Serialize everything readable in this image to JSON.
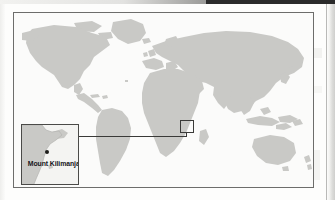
{
  "figure": {
    "kind": "locator-map"
  },
  "map": {
    "projection_note": "world",
    "ocean_color": "#fbfbfa",
    "land_color": "#c9c9c6",
    "frame_color": "#6d6d6b"
  },
  "locator": {
    "name": "locator-rectangle",
    "stroke_color": "#3a3a38",
    "region": "East Africa"
  },
  "connector": {
    "name": "leader-line",
    "stroke_color": "#3a3a38"
  },
  "inset": {
    "name": "detail-inset",
    "border_color": "#4a4a48",
    "background_color": "#f4f4f2",
    "land_color": "#c9c9c6",
    "marker": {
      "name": "summit-marker",
      "color": "#1d1d1b",
      "shape": "dot"
    },
    "label": "Mount Kilimanjaro",
    "label_color": "#16161a"
  },
  "scan": {
    "top_bar_color": "#2b2b2b",
    "gutter_color": "#cfcfcd",
    "page_color": "#fdfdfc"
  }
}
